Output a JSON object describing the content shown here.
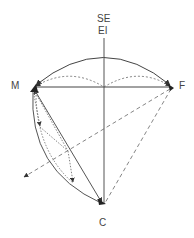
{
  "labels": {
    "top1": "SE",
    "top2": "EI",
    "left": "M",
    "right": "F",
    "bottom": "C"
  },
  "colors": {
    "stroke": "#555555",
    "text": "#444444",
    "background": "#ffffff"
  },
  "nodes": {
    "M": [
      34,
      87
    ],
    "F": [
      172,
      87
    ],
    "C": [
      104,
      204
    ],
    "center": [
      104,
      87
    ]
  }
}
